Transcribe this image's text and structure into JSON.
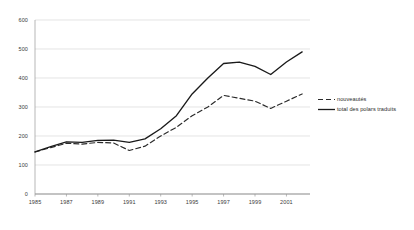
{
  "chart_data": {
    "type": "line",
    "title": "",
    "xlabel": "",
    "ylabel": "",
    "xlim": [
      1985,
      2002.5
    ],
    "ylim": [
      0,
      600
    ],
    "grid": true,
    "legend_position": "right",
    "x": [
      1985,
      1986,
      1987,
      1988,
      1989,
      1990,
      1991,
      1992,
      1993,
      1994,
      1995,
      1996,
      1997,
      1998,
      1999,
      2000,
      2001,
      2002
    ],
    "xtick_labels": [
      "1985",
      "1987",
      "1989",
      "1991",
      "1993",
      "1995",
      "1997",
      "1999",
      "2001"
    ],
    "xticks": [
      1985,
      1987,
      1989,
      1991,
      1993,
      1995,
      1997,
      1999,
      2001
    ],
    "ytick_labels": [
      "0",
      "100",
      "200",
      "300",
      "400",
      "500",
      "600"
    ],
    "yticks": [
      0,
      100,
      200,
      300,
      400,
      500,
      600
    ],
    "series": [
      {
        "name": "nouveautés",
        "style": "dashed",
        "color": "#2b2b2b",
        "values": [
          145,
          160,
          175,
          172,
          178,
          176,
          150,
          165,
          200,
          230,
          270,
          300,
          340,
          330,
          320,
          295,
          320,
          345
        ]
      },
      {
        "name": "total des polars traduits",
        "style": "solid",
        "color": "#1a1a1a",
        "values": [
          145,
          163,
          180,
          178,
          185,
          186,
          178,
          190,
          225,
          270,
          345,
          400,
          450,
          455,
          440,
          412,
          455,
          490
        ]
      }
    ]
  },
  "legend": {
    "items": [
      {
        "label": "nouveautés",
        "style": "dashed"
      },
      {
        "label": "total des polars traduits",
        "style": "solid"
      }
    ]
  },
  "axes": {
    "y_axis_name": "value-axis",
    "x_axis_name": "year-axis"
  }
}
